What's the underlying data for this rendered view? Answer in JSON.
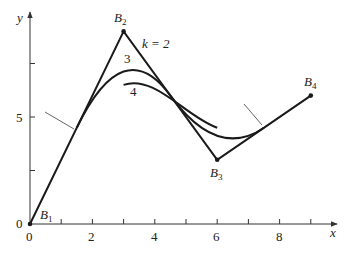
{
  "figure": {
    "axes": {
      "x_label": "x",
      "y_label": "y",
      "x_tick_labels": [
        "0",
        "2",
        "4",
        "6",
        "8"
      ],
      "y_tick_labels": [
        "0",
        "5"
      ],
      "x_range": [
        0,
        9.5
      ],
      "y_range": [
        0,
        10
      ]
    },
    "control_points": [
      {
        "name": "B",
        "sub": "1",
        "x": 0,
        "y": 0
      },
      {
        "name": "B",
        "sub": "2",
        "x": 3,
        "y": 9
      },
      {
        "name": "B",
        "sub": "3",
        "x": 6,
        "y": 3
      },
      {
        "name": "B",
        "sub": "4",
        "x": 9,
        "y": 6
      }
    ],
    "curve_labels": {
      "k2": "k = 2",
      "k3": "3",
      "k4": "4"
    },
    "colors": {
      "line": "#1a1a1a",
      "axis": "#333333",
      "background": "#ffffff"
    }
  }
}
